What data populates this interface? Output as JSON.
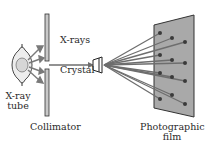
{
  "labels": {
    "tube_line1": "X-ray",
    "tube_line2": "tube",
    "xrays": "X-rays",
    "crystal": "Crystal",
    "collimator": "Collimator",
    "film_line1": "Photographic",
    "film_line2": "film"
  },
  "colors": {
    "ray": "#6e6e6e",
    "collimator_fill": "#c8c8c8",
    "film_fill": "#a9a9a9",
    "outline": "#333333",
    "text": "#2a2a2a"
  },
  "film_spots": [
    {
      "x": 160,
      "y": 33
    },
    {
      "x": 172,
      "y": 38
    },
    {
      "x": 185,
      "y": 42
    },
    {
      "x": 160,
      "y": 55
    },
    {
      "x": 172,
      "y": 60
    },
    {
      "x": 185,
      "y": 63
    },
    {
      "x": 160,
      "y": 73
    },
    {
      "x": 172,
      "y": 77
    },
    {
      "x": 185,
      "y": 81
    },
    {
      "x": 172,
      "y": 95
    },
    {
      "x": 160,
      "y": 99
    },
    {
      "x": 185,
      "y": 104
    }
  ]
}
